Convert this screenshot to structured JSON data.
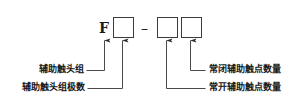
{
  "diagram": {
    "kind": "model-designation-breakdown",
    "code": {
      "prefix_letter": "F",
      "separator": "–",
      "boxes": [
        {
          "id": "box-pole-count",
          "value": ""
        },
        {
          "id": "box-no-count",
          "value": ""
        },
        {
          "id": "box-nc-count",
          "value": ""
        }
      ]
    },
    "callouts": [
      {
        "id": "callout-contact-group",
        "label": "辅助触头组",
        "side": "left",
        "target": "prefix-letter-F"
      },
      {
        "id": "callout-pole-number",
        "label": "辅助触头组极数",
        "side": "left",
        "target": "box-pole-count"
      },
      {
        "id": "callout-nc-quantity",
        "label": "常闭辅助触点数量",
        "side": "right",
        "target": "box-nc-count"
      },
      {
        "id": "callout-no-quantity",
        "label": "常开辅助触点数量",
        "side": "right",
        "target": "box-no-count"
      }
    ],
    "colors": {
      "background": "#ffffff",
      "stroke": "#3b3b3b",
      "text": "#171717",
      "arrow": "#2a2a2a"
    }
  }
}
